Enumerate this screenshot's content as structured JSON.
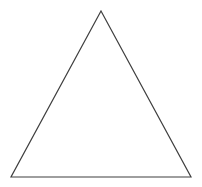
{
  "canvas": {
    "width": 202,
    "height": 187,
    "background_color": "#ffffff",
    "has_border": false,
    "description": "Plain white drawing canvas containing a single line-drawn triangle outline"
  },
  "figure": {
    "name": "triangle",
    "shape_type": "triangle",
    "classification": "isosceles",
    "fill": "none",
    "stroke_color": "#3f3f3f",
    "stroke_width": 1.2,
    "vertices": [
      {
        "label": "apex",
        "x": 101,
        "y": 11
      },
      {
        "label": "bottom-right",
        "x": 191,
        "y": 177
      },
      {
        "label": "bottom-left",
        "x": 11,
        "y": 177
      }
    ],
    "points_attr": "101,11 191,177 11,177",
    "measurements": {
      "base_width": 180,
      "height": 166,
      "apex_x": 101
    },
    "edges": [
      {
        "name": "left-edge",
        "from": "bottom-left",
        "to": "apex"
      },
      {
        "name": "right-edge",
        "from": "apex",
        "to": "bottom-right"
      },
      {
        "name": "base-edge",
        "from": "bottom-left",
        "to": "bottom-right"
      }
    ]
  },
  "annotations": {
    "labels": [],
    "text": []
  }
}
